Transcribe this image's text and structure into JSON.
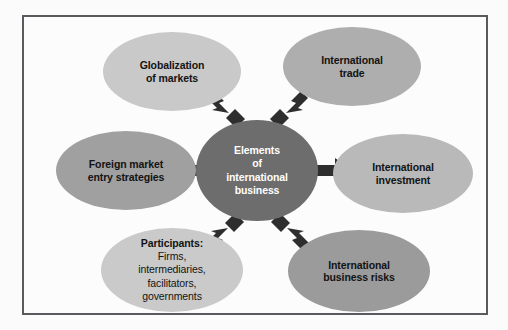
{
  "diagram": {
    "title": "Elements of international business",
    "frame": {
      "border_color": "#585a5e",
      "background": "#fcfcfc"
    },
    "center": {
      "name": "elements-of-international-business",
      "lines": [
        "Elements",
        "of",
        "international",
        "business"
      ],
      "text": "Elements of international business",
      "fill": "#6d6d6d",
      "text_color": "#ffffff"
    },
    "nodes": [
      {
        "name": "globalization-of-markets",
        "lines": [
          "Globalization",
          "of markets"
        ],
        "text": "Globalization of markets",
        "fill": "#c9c9c9",
        "position": "top-left"
      },
      {
        "name": "international-trade",
        "lines": [
          "International",
          "trade"
        ],
        "text": "International trade",
        "fill": "#aeaeae",
        "position": "top-right"
      },
      {
        "name": "foreign-market-entry-strategies",
        "lines": [
          "Foreign market",
          "entry strategies"
        ],
        "text": "Foreign market entry strategies",
        "fill": "#a0a0a0",
        "position": "middle-left"
      },
      {
        "name": "international-investment",
        "lines": [
          "International",
          "investment"
        ],
        "text": "International investment",
        "fill": "#b9b9b9",
        "position": "middle-right"
      },
      {
        "name": "participants",
        "heading": "Participants:",
        "lines": [
          "Firms,",
          "intermediaries,",
          "facilitators,",
          "governments"
        ],
        "text": "Participants: Firms, intermediaries, facilitators, governments",
        "fill": "#cacaca",
        "position": "bottom-left"
      },
      {
        "name": "international-business-risks",
        "lines": [
          "International",
          "business risks"
        ],
        "text": "International business risks",
        "fill": "#9b9b9b",
        "position": "bottom-right"
      }
    ],
    "arrows": {
      "color": "#2e2e2e",
      "count": 6,
      "directions": [
        "up-left",
        "up-right",
        "left",
        "right",
        "down-left",
        "down-right"
      ]
    }
  }
}
